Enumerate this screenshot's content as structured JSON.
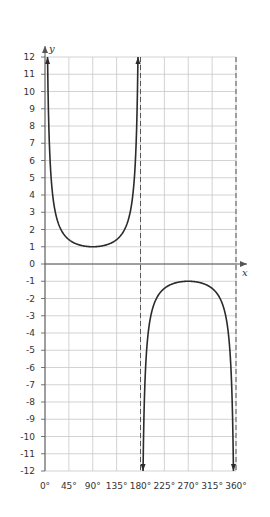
{
  "chart_data": {
    "type": "line",
    "title": "",
    "function": "y = cosec x",
    "xlabel": "x",
    "ylabel": "y",
    "xlim": [
      0,
      360
    ],
    "ylim": [
      -12,
      12
    ],
    "x_ticks": [
      0,
      45,
      90,
      135,
      180,
      225,
      270,
      315,
      360
    ],
    "x_tick_labels": [
      "0°",
      "45°",
      "90°",
      "135°",
      "180°",
      "225°",
      "270°",
      "315°",
      "360°"
    ],
    "y_ticks": [
      12,
      11,
      10,
      9,
      8,
      7,
      6,
      5,
      4,
      3,
      2,
      1,
      0,
      -1,
      -2,
      -3,
      -4,
      -5,
      -6,
      -7,
      -8,
      -9,
      -10,
      -11,
      -12
    ],
    "y_tick_labels": [
      "12",
      "11",
      "10",
      "9",
      "8",
      "7",
      "6",
      "5",
      "4",
      "3",
      "2",
      "1",
      "0",
      "-1",
      "-2",
      "-3",
      "-4",
      "-5",
      "-6",
      "-7",
      "-8",
      "-9",
      "-10",
      "-11",
      "-12"
    ],
    "grid": true,
    "asymptotes": [
      0,
      180,
      360
    ],
    "series": [
      {
        "name": "branch 1 (0° < x < 180°)",
        "x": [
          4.8,
          10,
          20,
          30,
          45,
          60,
          90,
          120,
          135,
          150,
          160,
          170,
          175.2
        ],
        "y": [
          12,
          5.76,
          2.92,
          2,
          1.41,
          1.15,
          1,
          1.15,
          1.41,
          2,
          2.92,
          5.76,
          12
        ]
      },
      {
        "name": "branch 2 (180° < x < 360°)",
        "x": [
          184.8,
          190,
          200,
          210,
          225,
          240,
          270,
          300,
          315,
          330,
          340,
          350,
          355.2
        ],
        "y": [
          -12,
          -5.76,
          -2.92,
          -2,
          -1.41,
          -1.15,
          -1,
          -1.15,
          -1.41,
          -2,
          -2.92,
          -5.76,
          -12
        ]
      }
    ],
    "legend": null
  },
  "colors": {
    "curve": "#2b2b2b",
    "grid": "#c8c8c8",
    "axis": "#555555",
    "asymptote": "#555555"
  }
}
